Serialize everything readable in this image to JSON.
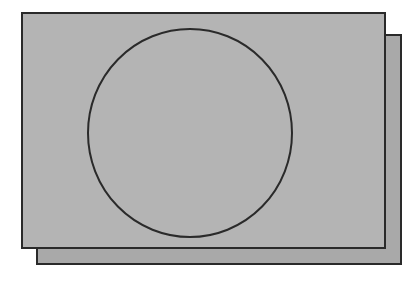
{
  "diagram": {
    "colors": {
      "background": "#ffffff",
      "front_fill": "#b4b4b4",
      "back_fill": "#a9a9a9",
      "stroke": "#2a2a2a"
    },
    "back_sheet": {
      "x": 37,
      "y": 35,
      "width": 364,
      "height": 229
    },
    "front_sheet": {
      "x": 22,
      "y": 13,
      "width": 363,
      "height": 235
    },
    "circle": {
      "cx": 190,
      "cy": 133,
      "rx": 102,
      "ry": 104
    }
  }
}
